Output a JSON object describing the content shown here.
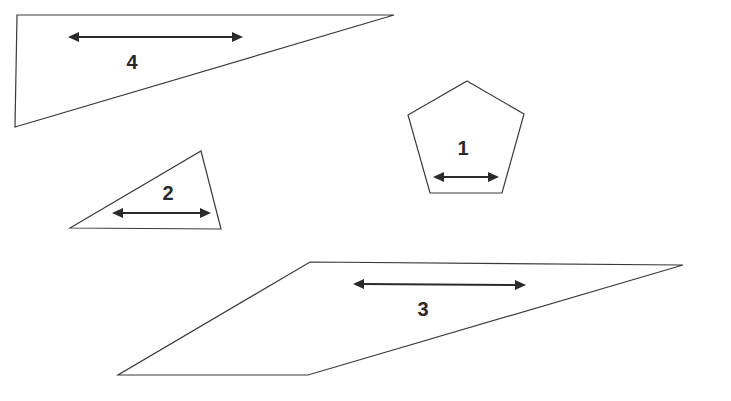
{
  "canvas": {
    "width": 731,
    "height": 401,
    "background": "#ffffff"
  },
  "shapes": [
    {
      "id": "shape-4",
      "type": "triangle",
      "label": "4",
      "points": "17,15 394,15 15,127",
      "arrow": {
        "x1": 68,
        "y1": 37,
        "x2": 243,
        "y2": 37
      },
      "label_pos": {
        "x": 132,
        "y": 64
      }
    },
    {
      "id": "shape-1",
      "type": "pentagon",
      "label": "1",
      "points": "467,81 524,114 502,193 430,193 408,115",
      "arrow": {
        "x1": 433,
        "y1": 177,
        "x2": 499,
        "y2": 177
      },
      "label_pos": {
        "x": 463,
        "y": 150
      }
    },
    {
      "id": "shape-2",
      "type": "triangle",
      "label": "2",
      "points": "70,228 201,151 221,229",
      "arrow": {
        "x1": 112,
        "y1": 213,
        "x2": 211,
        "y2": 213
      },
      "label_pos": {
        "x": 168,
        "y": 195
      }
    },
    {
      "id": "shape-3",
      "type": "parallelogram",
      "label": "3",
      "points": "310,262 683,265 308,375 118,375",
      "arrow": {
        "x1": 353,
        "y1": 284,
        "x2": 526,
        "y2": 285
      },
      "label_pos": {
        "x": 423,
        "y": 311
      }
    }
  ],
  "colors": {
    "stroke": "#3a3a3a",
    "arrow": "#2a2a2a",
    "text": "#2a2a2a"
  }
}
